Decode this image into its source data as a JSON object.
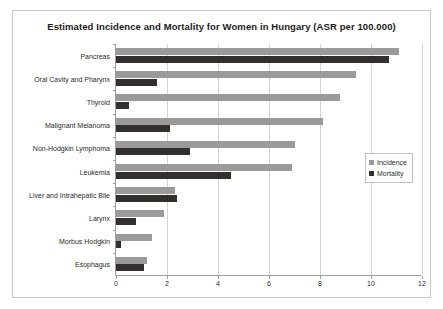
{
  "chart_data": {
    "type": "bar",
    "orientation": "horizontal",
    "title": "Estimated Incidence and Mortality for Women in Hungary (ASR per 100.000)",
    "xlabel": "",
    "ylabel": "",
    "xlim": [
      0,
      12
    ],
    "xticks": [
      0,
      2,
      4,
      6,
      8,
      10,
      12
    ],
    "grid": true,
    "legend_position": "right",
    "categories": [
      "Pancreas",
      "Oral Cavity and Pharynx",
      "Thyroid",
      "Malignant Melanoma",
      "Non-Hodgkin Lymphoma",
      "Leukemia",
      "Liver and Intrahepatic Bile",
      "Larynx",
      "Morbus Hodgkin",
      "Esophagus"
    ],
    "series": [
      {
        "name": "Incidence",
        "color": "#9a9a9a",
        "values": [
          11.1,
          9.4,
          8.8,
          8.1,
          7.0,
          6.9,
          2.3,
          1.9,
          1.4,
          1.2
        ]
      },
      {
        "name": "Mortality",
        "color": "#332f2d",
        "values": [
          10.7,
          1.6,
          0.5,
          2.1,
          2.9,
          4.5,
          2.4,
          0.8,
          0.2,
          1.1
        ]
      }
    ]
  }
}
